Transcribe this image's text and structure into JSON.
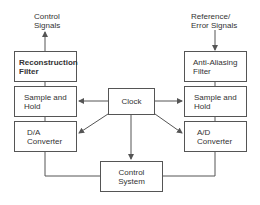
{
  "diagram": {
    "signals": {
      "output_label_line1": "Control",
      "output_label_line2": "Signals",
      "input_label_line1": "Reference/",
      "input_label_line2": "Error Signals"
    },
    "left_chain": {
      "reconstruction_filter": {
        "line1": "Reconstruction",
        "line2": "Filter"
      },
      "sample_hold": {
        "line1": "Sample and",
        "line2": "Hold"
      },
      "converter": {
        "line1": "D/A",
        "line2": "Converter"
      }
    },
    "right_chain": {
      "anti_aliasing_filter": {
        "line1": "Anti-Aliasing",
        "line2": "Filter"
      },
      "sample_hold": {
        "line1": "Sample and",
        "line2": "Hold"
      },
      "converter": {
        "line1": "A/D",
        "line2": "Converter"
      }
    },
    "clock": {
      "label": "Clock"
    },
    "control_system": {
      "line1": "Control",
      "line2": "System"
    },
    "colors": {
      "line": "#555555",
      "text": "#333333",
      "background": "#ffffff"
    }
  }
}
